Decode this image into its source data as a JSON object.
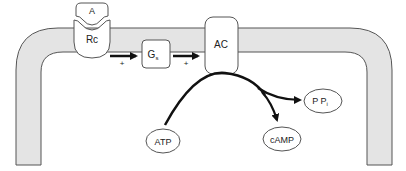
{
  "diagram": {
    "type": "signal-transduction",
    "colors": {
      "membrane_fill": "#e4e4e4",
      "stroke": "#555555",
      "arrow": "#111111",
      "background": "#ffffff"
    },
    "nodes": {
      "agonist": {
        "label": "A"
      },
      "receptor": {
        "label": "Rc"
      },
      "g_protein": {
        "label": "G",
        "subscript": "s"
      },
      "adenylyl_cyclase": {
        "label": "AC"
      },
      "atp": {
        "label": "ATP"
      },
      "camp": {
        "label": "cAMP"
      },
      "ppi": {
        "label": "P P",
        "subscript": "i"
      }
    },
    "edges": [
      {
        "from": "receptor",
        "to": "g_protein",
        "sign": "+"
      },
      {
        "from": "g_protein",
        "to": "adenylyl_cyclase",
        "sign": "+"
      },
      {
        "from": "atp",
        "to": "camp",
        "via": "adenylyl_cyclase"
      },
      {
        "from": "atp",
        "to": "ppi",
        "via": "adenylyl_cyclase"
      }
    ]
  }
}
